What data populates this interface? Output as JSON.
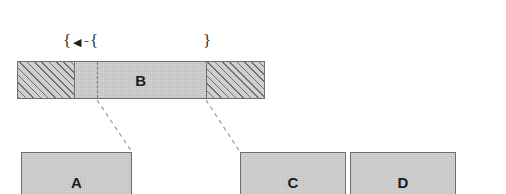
{
  "figure": {
    "type": "segmented-bar-decomposition-diagram",
    "background_color": "#ffffff",
    "ink_color": "#1c1c1c",
    "line_color": "#6e6e6e",
    "fill_color": "#d4d4d4",
    "hatch_color": "#6f6f6f"
  },
  "annotations": {
    "left_brace": "{",
    "arrow_glyph": "◀",
    "dash_glyph": "–",
    "mid_brace": "{",
    "right_brace": "}"
  },
  "bar": {
    "label": "B",
    "segments": [
      {
        "name": "left-hatched",
        "fill": "hatch",
        "label": ""
      },
      {
        "name": "middle-plain",
        "fill": "plain",
        "label": "B"
      },
      {
        "name": "right-hatched",
        "fill": "hatch",
        "label": ""
      }
    ],
    "cut_line": "dashed"
  },
  "nodes": [
    {
      "id": "A",
      "label": "A"
    },
    {
      "id": "C",
      "label": "C"
    },
    {
      "id": "D",
      "label": "D"
    }
  ],
  "connectors": [
    {
      "from": "bar-cut-line",
      "to": "node-A",
      "style": "dashed"
    },
    {
      "from": "bar-right-boundary",
      "to": "node-C",
      "style": "dashed"
    }
  ]
}
